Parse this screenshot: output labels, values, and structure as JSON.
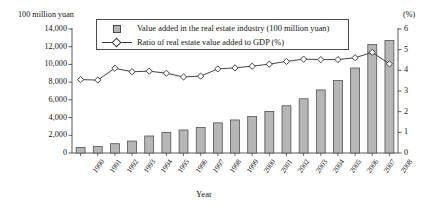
{
  "axis_left_unit": "100 million yuan",
  "axis_right_unit": "(%)",
  "axis_x_title": "Year",
  "legend": {
    "bar_label": "Value added in the real estate industry (100 million yuan)",
    "line_label": "Ratio of real estate value added to GDP (%)",
    "bar_swatch_icon": "bar-swatch-icon",
    "line_swatch_icon": "line-diamond-swatch-icon"
  },
  "colors": {
    "bar_fill": "#b6b6b6",
    "bar_stroke": "#4a4a4a",
    "line_stroke": "#3a3a3a",
    "marker_fill": "#ffffff",
    "axis": "#4a4a4a",
    "text": "#141414",
    "background": "#ffffff"
  },
  "y_left_ticks": [
    "0",
    "2,000",
    "4,000",
    "6,000",
    "8,000",
    "10,000",
    "12,000",
    "14,000"
  ],
  "y_right_ticks": [
    "0",
    "1",
    "2",
    "3",
    "4",
    "5",
    "6"
  ],
  "chart_data": {
    "type": "bar",
    "title": "",
    "subtitle": "",
    "xlabel": "Year",
    "ylabel": "100 million yuan",
    "y2label": "(%)",
    "ylim": [
      0,
      14000
    ],
    "y2lim": [
      0,
      6
    ],
    "grid": false,
    "legend_position": "top-center-inside",
    "categories": [
      "1990",
      "1991",
      "1992",
      "1993",
      "1994",
      "1995",
      "1996",
      "1997",
      "1998",
      "1999",
      "2000",
      "2001",
      "2002",
      "2003",
      "2004",
      "2005",
      "2006",
      "2007",
      "2008"
    ],
    "series": [
      {
        "name": "Value added in the real estate industry (100 million yuan)",
        "type": "bar",
        "axis": "left",
        "values": [
          620,
          740,
          1050,
          1350,
          1920,
          2330,
          2600,
          2880,
          3400,
          3730,
          4120,
          4700,
          5330,
          6120,
          7120,
          8180,
          9600,
          12250,
          12700
        ]
      },
      {
        "name": "Ratio of real estate value added to GDP (%)",
        "type": "line",
        "axis": "right",
        "marker": "diamond",
        "values": [
          3.55,
          3.53,
          4.1,
          3.93,
          3.96,
          3.86,
          3.68,
          3.72,
          4.07,
          4.12,
          4.2,
          4.3,
          4.43,
          4.54,
          4.52,
          4.52,
          4.61,
          4.87,
          4.31
        ]
      }
    ]
  }
}
